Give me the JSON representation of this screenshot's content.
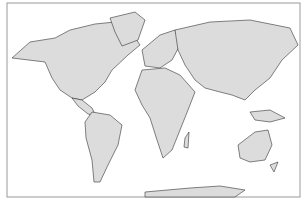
{
  "map": {
    "projection": "world",
    "land_color": "#dcdcdc",
    "outline_color": "#333333",
    "ocean_color": "#ffffff",
    "frame_color": "#999999"
  }
}
